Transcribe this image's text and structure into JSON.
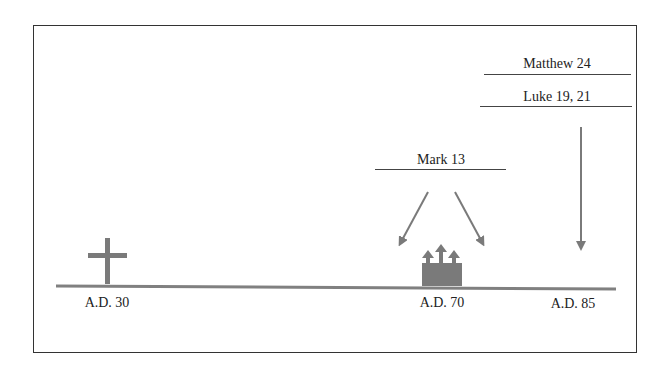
{
  "diagram": {
    "timeline": {
      "dates": [
        {
          "label": "A.D. 30",
          "event": "crucifixion",
          "icon": "cross-icon"
        },
        {
          "label": "A.D. 70",
          "event": "temple-destruction",
          "icon": "temple-icon"
        },
        {
          "label": "A.D. 85",
          "event": "later-gospels"
        }
      ]
    },
    "sources": [
      {
        "label": "Mark 13"
      },
      {
        "label": "Matthew 24"
      },
      {
        "label": "Luke 19, 21"
      }
    ],
    "colors": {
      "timeline": "#808080",
      "icon": "#7a7a7a",
      "text": "#222222",
      "frame": "#333333"
    }
  }
}
